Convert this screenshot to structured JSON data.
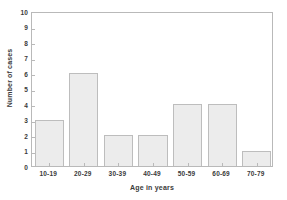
{
  "chart_data": {
    "type": "bar",
    "title": "",
    "subtitle": "",
    "xlabel": "Age in years",
    "ylabel": "Number of cases",
    "categories": [
      "10-19",
      "20-29",
      "30-39",
      "40-49",
      "50-59",
      "60-69",
      "70-79"
    ],
    "values": [
      3,
      6,
      2,
      2,
      4,
      4,
      1
    ],
    "ylim": [
      0,
      10
    ],
    "yticks": [
      0,
      1,
      2,
      3,
      4,
      5,
      6,
      7,
      8,
      9,
      10
    ],
    "ytick_labels": [
      "0",
      "1",
      "2",
      "3",
      "4",
      "5",
      "6",
      "7",
      "8",
      "9",
      "10"
    ],
    "grid": false,
    "legend": false,
    "legend_position": "none",
    "bar_fill_color": "#ececec",
    "bar_edge_color": "#bdbdbd",
    "axis_color": "#b9b9b9",
    "text_color": "#3a3a3a",
    "background_color": "#ffffff",
    "tick_direction": "in",
    "frame": "full-box"
  }
}
